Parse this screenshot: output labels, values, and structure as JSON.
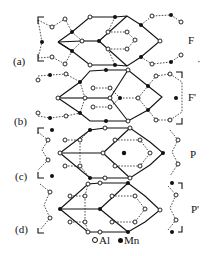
{
  "figure": {
    "panels": [
      {
        "label": "(a)",
        "structure": "F"
      },
      {
        "label": "(b)",
        "structure": "F'"
      },
      {
        "label": "(c)",
        "structure": "P"
      },
      {
        "label": "(d)",
        "structure": "P'"
      }
    ],
    "stray_mark": "·",
    "legend": {
      "al_label": "Al",
      "mn_label": "Mn"
    },
    "colors": {
      "ink": "#111111",
      "background": "#ffffff"
    }
  }
}
